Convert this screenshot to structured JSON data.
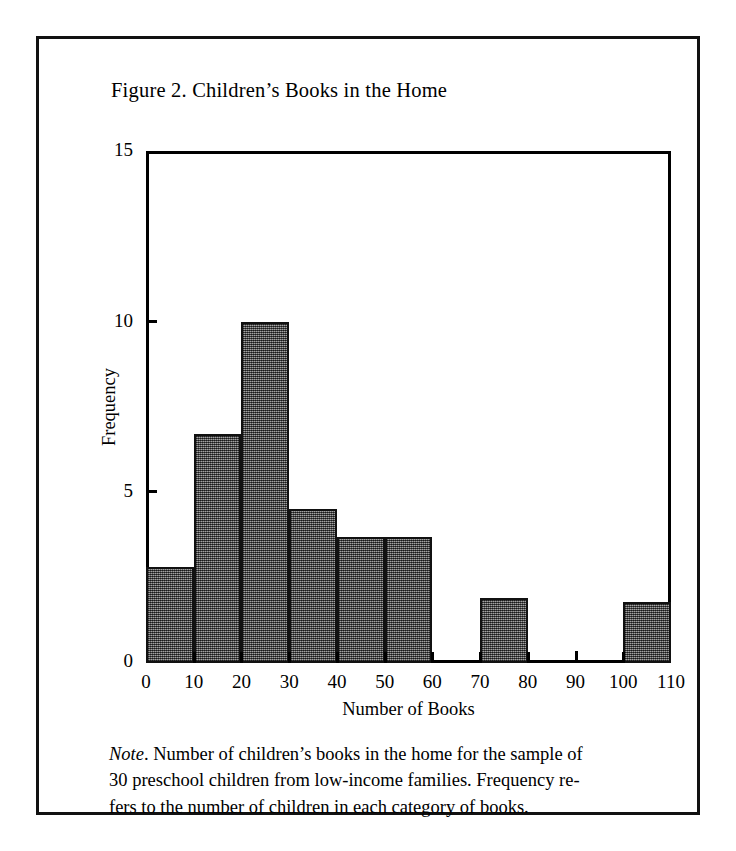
{
  "figure": {
    "title": "Figure 2.  Children’s Books in the Home",
    "note_word": "Note",
    "note_lines": [
      ".  Number of children’s books in the home for the sample of",
      "30 preschool children from low-income families.  Frequency re-",
      "fers to the number of children in each category of books."
    ]
  },
  "colors": {
    "bar_fill": "#6b6b6b",
    "axis": "#000000",
    "frame": "#111111",
    "background": "#ffffff"
  },
  "chart_data": {
    "type": "bar",
    "title": "Figure 2.  Children’s Books in the Home",
    "subtitle": "",
    "xlabel": "Number of Books",
    "ylabel": "Frequency",
    "xlim": [
      0,
      110
    ],
    "ylim": [
      0,
      15
    ],
    "grid": false,
    "legend": "none",
    "histogram": true,
    "bin_width": 10,
    "xticks": [
      0,
      10,
      20,
      30,
      40,
      50,
      60,
      70,
      80,
      90,
      100,
      110
    ],
    "xtick_labels": [
      "0",
      "10",
      "20",
      "30",
      "40",
      "50",
      "60",
      "70",
      "80",
      "90",
      "100",
      "110"
    ],
    "yticks": [
      0,
      5,
      10,
      15
    ],
    "ytick_labels": [
      "0",
      "5",
      "10",
      "15"
    ],
    "bins": [
      {
        "label": "0-10",
        "x0": 0,
        "x1": 10,
        "value": 2.8
      },
      {
        "label": "10-20",
        "x0": 10,
        "x1": 20,
        "value": 6.7
      },
      {
        "label": "20-30",
        "x0": 20,
        "x1": 30,
        "value": 10
      },
      {
        "label": "30-40",
        "x0": 30,
        "x1": 40,
        "value": 4.5
      },
      {
        "label": "40-50",
        "x0": 40,
        "x1": 50,
        "value": 3.7
      },
      {
        "label": "50-60",
        "x0": 50,
        "x1": 60,
        "value": 3.7
      },
      {
        "label": "60-70",
        "x0": 60,
        "x1": 70,
        "value": 0
      },
      {
        "label": "70-80",
        "x0": 70,
        "x1": 80,
        "value": 1.9
      },
      {
        "label": "80-90",
        "x0": 80,
        "x1": 90,
        "value": 0
      },
      {
        "label": "90-100",
        "x0": 90,
        "x1": 100,
        "value": 0
      },
      {
        "label": "100-110",
        "x0": 100,
        "x1": 110,
        "value": 1.8
      }
    ],
    "categories": [
      "0-10",
      "10-20",
      "20-30",
      "30-40",
      "40-50",
      "50-60",
      "60-70",
      "70-80",
      "80-90",
      "90-100",
      "100-110"
    ],
    "values": [
      2.8,
      6.7,
      10,
      4.5,
      3.7,
      3.7,
      0,
      1.9,
      0,
      0,
      1.8
    ],
    "annotations": [
      {
        "type": "tick-mark",
        "x": 90,
        "value": 0.35,
        "note": "small mark on baseline at 90"
      }
    ]
  }
}
